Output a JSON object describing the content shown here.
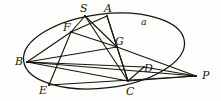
{
  "figure": {
    "kind": "geometry-diagram",
    "stroke_color": "#15150f",
    "background_color": "#fdfdfc",
    "curve_label": "a",
    "points": [
      {
        "id": "S",
        "label": "S",
        "x": 85,
        "y": 16,
        "label_x": 80,
        "label_y": 3
      },
      {
        "id": "A",
        "label": "A",
        "x": 107,
        "y": 16,
        "label_x": 104,
        "label_y": 3
      },
      {
        "id": "F",
        "label": "F",
        "x": 71,
        "y": 32,
        "label_x": 63,
        "label_y": 22
      },
      {
        "id": "G",
        "label": "G",
        "x": 117,
        "y": 47,
        "label_x": 115,
        "label_y": 36
      },
      {
        "id": "B",
        "label": "B",
        "x": 27,
        "y": 62,
        "label_x": 15,
        "label_y": 56
      },
      {
        "id": "D",
        "label": "D",
        "x": 144,
        "y": 67,
        "label_x": 144,
        "label_y": 63
      },
      {
        "id": "P",
        "label": "P",
        "x": 196,
        "y": 76,
        "label_x": 202,
        "label_y": 70
      },
      {
        "id": "E",
        "label": "E",
        "x": 49,
        "y": 85,
        "label_x": 39,
        "label_y": 85
      },
      {
        "id": "C",
        "label": "C",
        "x": 128,
        "y": 81,
        "label_x": 126,
        "label_y": 86
      }
    ],
    "curve_label_pos": {
      "x": 141,
      "y": 17
    },
    "ellipse": {
      "cx": 104,
      "cy": 51,
      "rx": 81,
      "ry": 37,
      "rotation_deg": -7
    },
    "segments": [
      {
        "from": "S",
        "to": "G"
      },
      {
        "from": "S",
        "to": "C"
      },
      {
        "from": "A",
        "to": "F"
      },
      {
        "from": "A",
        "to": "G"
      },
      {
        "from": "A",
        "to": "C"
      },
      {
        "from": "F",
        "to": "G"
      },
      {
        "from": "F",
        "to": "B"
      },
      {
        "from": "F",
        "to": "E"
      },
      {
        "from": "F",
        "to": "S"
      },
      {
        "from": "G",
        "to": "B"
      },
      {
        "from": "G",
        "to": "P"
      },
      {
        "from": "G",
        "to": "C"
      },
      {
        "from": "B",
        "to": "D"
      },
      {
        "from": "B",
        "to": "C"
      },
      {
        "from": "B",
        "to": "P"
      },
      {
        "from": "E",
        "to": "P"
      },
      {
        "from": "D",
        "to": "P"
      },
      {
        "from": "C",
        "to": "P"
      },
      {
        "from": "C",
        "to": "D"
      }
    ]
  }
}
